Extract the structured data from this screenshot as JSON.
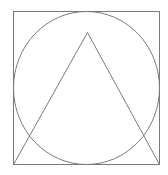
{
  "figure": {
    "width": 168,
    "height": 175,
    "background": "#ffffff",
    "stroke_color": "#7a7a7a",
    "stroke_width": 1,
    "square": {
      "x": 13,
      "y": 11,
      "width": 146,
      "height": 153
    },
    "circle": {
      "cx": 86,
      "cy": 87.5,
      "rx": 73,
      "ry": 76.5
    },
    "triangle": {
      "apex": [
        87,
        32
      ],
      "base_left": [
        13,
        164
      ],
      "base_right": [
        159,
        164
      ]
    }
  }
}
